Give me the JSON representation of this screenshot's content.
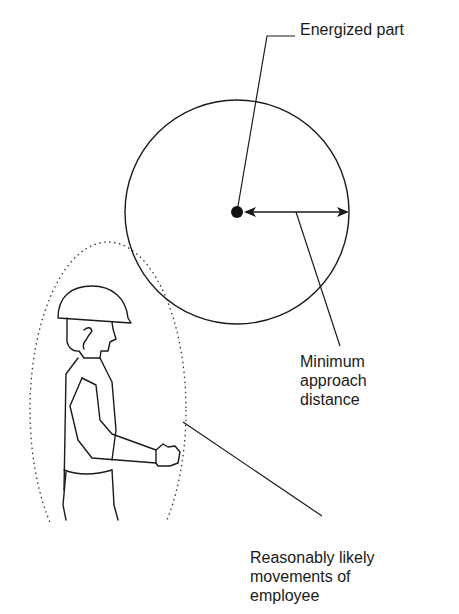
{
  "diagram": {
    "type": "safety-illustration",
    "labels": {
      "energized_part": "Energized part",
      "minimum_approach_distance": [
        "Minimum",
        "approach",
        "distance"
      ],
      "reasonably_likely_movements": [
        "Reasonably likely",
        "movements of",
        "employee"
      ]
    },
    "elements": {
      "energized_point": {
        "cx": 237,
        "cy": 212,
        "r": 6
      },
      "approach_circle": {
        "cx": 237,
        "cy": 212,
        "r": 112
      },
      "movement_envelope": {
        "shape": "dotted-ellipse",
        "cx": 105,
        "cy": 400,
        "rx": 78,
        "ry": 165
      },
      "worker": "hard-hat worker silhouette, arm extended"
    },
    "colors": {
      "stroke": "#1a1a1a",
      "background": "#ffffff"
    }
  }
}
